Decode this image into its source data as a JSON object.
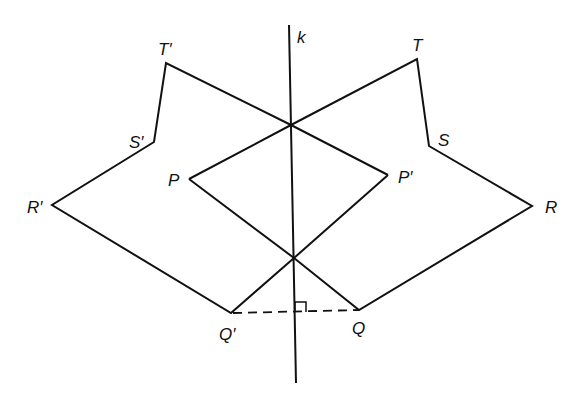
{
  "diagram": {
    "line_label": "k",
    "points": {
      "T_prime": {
        "label": "T′"
      },
      "S_prime": {
        "label": "S′"
      },
      "R_prime": {
        "label": "R′"
      },
      "P": {
        "label": "P"
      },
      "Q_prime": {
        "label": "Q′"
      },
      "T": {
        "label": "T"
      },
      "S": {
        "label": "S"
      },
      "R": {
        "label": "R"
      },
      "P_prime": {
        "label": "P′"
      },
      "Q": {
        "label": "Q"
      }
    },
    "annotations": {
      "right_angle": "QQ′ perpendicular to k (dashed segment)"
    }
  }
}
